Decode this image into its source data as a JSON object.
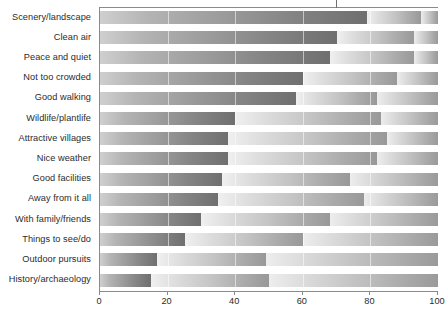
{
  "chart_data": {
    "type": "bar",
    "title": "",
    "subtitle": "",
    "xlabel": "",
    "ylabel": "",
    "orientation": "horizontal",
    "stacked": true,
    "grid": false,
    "legend_position": "none",
    "xlim": [
      0,
      100
    ],
    "xticks": [
      0,
      20,
      40,
      60,
      80,
      100
    ],
    "xtick_labels": [
      "0",
      "20",
      "40",
      "60",
      "80",
      "100"
    ],
    "categories": [
      "Scenery/landscape",
      "Clean air",
      "Peace and quiet",
      "Not too crowded",
      "Good walking",
      "Wildlife/plantlife",
      "Attractive villages",
      "Nice weather",
      "Good facilities",
      "Away from it all",
      "With family/friends",
      "Things to see/do",
      "Outdoor pursuits",
      "History/archaeology"
    ],
    "series": [
      {
        "name": "Very important",
        "color": "#6f6f6f",
        "values": [
          79,
          70,
          68,
          60,
          58,
          40,
          38,
          38,
          36,
          35,
          30,
          25,
          17,
          15
        ]
      },
      {
        "name": "Fairly important",
        "color": "#b0b0b0",
        "values": [
          16,
          23,
          25,
          28,
          24,
          43,
          47,
          44,
          38,
          43,
          38,
          35,
          32,
          35
        ]
      },
      {
        "name": "Not important",
        "color": "#d4d4d4",
        "values": [
          5,
          7,
          7,
          12,
          18,
          17,
          15,
          18,
          26,
          22,
          32,
          40,
          51,
          50
        ]
      }
    ],
    "marker": {
      "name": "top-notch-marker",
      "value": 70
    }
  }
}
